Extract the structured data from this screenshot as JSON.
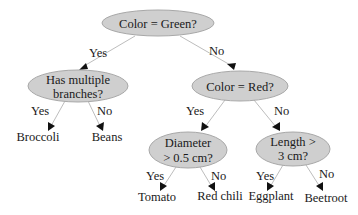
{
  "diagram": {
    "type": "decision-tree",
    "nodes": {
      "root": {
        "line1": "Color = Green?"
      },
      "branches": {
        "line1": "Has multiple",
        "line2": "branches?"
      },
      "red": {
        "line1": "Color = Red?"
      },
      "diameter": {
        "line1": "Diameter",
        "line2": "> 0.5 cm?"
      },
      "length": {
        "line1": "Length >",
        "line2": "3 cm?"
      }
    },
    "leaves": {
      "broccoli": "Broccoli",
      "beans": "Beans",
      "tomato": "Tomato",
      "red_chili": "Red chili",
      "eggplant": "Eggplant",
      "beetroot": "Beetroot"
    },
    "edge_labels": {
      "root_yes": "Yes",
      "root_no": "No",
      "branches_yes": "Yes",
      "branches_no": "No",
      "red_yes": "Yes",
      "red_no": "No",
      "diameter_yes": "Yes",
      "diameter_no": "No",
      "length_yes": "Yes",
      "length_no": "No"
    },
    "colors": {
      "node_fill": "#cfcfcf",
      "node_stroke": "#a8a8a8",
      "edge": "#bdbdbd",
      "arrow": "#111111",
      "text": "#1a1a1a",
      "background": "#ffffff"
    }
  }
}
